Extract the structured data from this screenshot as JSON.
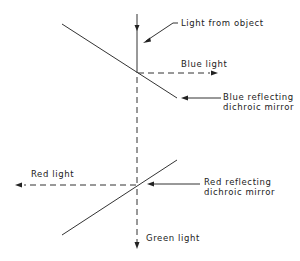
{
  "diagram": {
    "type": "optical beam-splitter schematic",
    "labels": {
      "incoming": "Light from object",
      "blue": "Blue light",
      "blue_mirror_line1": "Blue reflecting",
      "blue_mirror_line2": "dichroic mirror",
      "red": "Red light",
      "red_mirror_line1": "Red reflecting",
      "red_mirror_line2": "dichroic mirror",
      "green": "Green light"
    },
    "components": [
      {
        "id": "blue-mirror",
        "kind": "dichroic mirror",
        "reflects": "Blue light",
        "direction": "right"
      },
      {
        "id": "red-mirror",
        "kind": "dichroic mirror",
        "reflects": "Red light",
        "direction": "left"
      }
    ],
    "beams": [
      {
        "id": "incoming",
        "style": "solid",
        "direction": "down"
      },
      {
        "id": "blue",
        "style": "dashed",
        "direction": "right"
      },
      {
        "id": "red",
        "style": "dashed",
        "direction": "left"
      },
      {
        "id": "green",
        "style": "dashed",
        "direction": "down"
      }
    ]
  }
}
